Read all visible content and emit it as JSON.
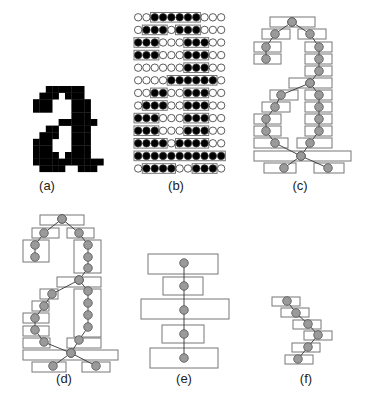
{
  "panels": {
    "a": {
      "label": "(a)",
      "description": "bitmap letter a"
    },
    "b": {
      "label": "(b)",
      "description": "pixel grid with runs boxed"
    },
    "c": {
      "label": "(c)",
      "description": "run graph"
    },
    "d": {
      "label": "(d)",
      "description": "merged run graph"
    },
    "e": {
      "label": "(e)",
      "description": "vertical stroke runs"
    },
    "f": {
      "label": "(f)",
      "description": "diagonal stroke runs"
    }
  },
  "grid_b": {
    "cols": 11,
    "rows": [
      "00111111000",
      "01110111000",
      "11100011100",
      "11100011100",
      "00000011100",
      "00001111110",
      "00110011100",
      "01110011100",
      "11100011100",
      "11100011100",
      "11110111100",
      "11111111111",
      "01111001110"
    ]
  },
  "colors": {
    "ink": "#000000",
    "node": "#9a9a9a",
    "box": "#777777"
  }
}
